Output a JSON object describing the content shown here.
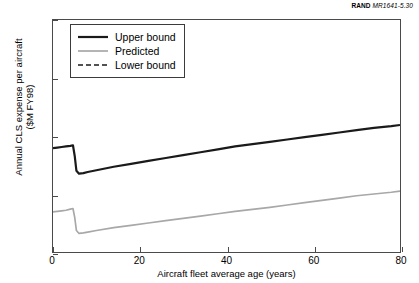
{
  "source_credit": {
    "organization": "RAND",
    "identifier": "MR1641-5.30"
  },
  "chart_data": {
    "type": "line",
    "title": "",
    "xlabel": "Aircraft fleet average age (years)",
    "ylabel": "Annual CLS expense per aircraft\n($M FY98)",
    "xlim": [
      0,
      80
    ],
    "ylim": [
      0,
      20
    ],
    "xticks": [
      0,
      20,
      40,
      60,
      80
    ],
    "yticks": [
      0,
      5,
      10,
      15,
      20
    ],
    "xtick_labels": [
      "0",
      "20",
      "40",
      "60",
      "80"
    ],
    "ytick_labels": [
      "0",
      "5",
      "10",
      "15",
      "20"
    ],
    "grid": false,
    "legend_position": "upper-left-inside",
    "series": [
      {
        "name": "Upper bound",
        "color": "#1a1a1a",
        "style": "solid",
        "width": 2.2,
        "x": [
          0,
          1,
          2,
          3,
          4,
          4.6,
          5,
          5.4,
          6,
          7,
          8,
          10,
          14,
          18,
          22,
          26,
          30,
          34,
          38,
          42,
          46,
          50,
          54,
          58,
          62,
          66,
          70,
          74,
          78,
          80
        ],
        "y": [
          8.95,
          9.0,
          9.05,
          9.1,
          9.15,
          9.2,
          8.3,
          7.0,
          6.75,
          6.8,
          6.9,
          7.05,
          7.35,
          7.6,
          7.85,
          8.1,
          8.35,
          8.6,
          8.85,
          9.1,
          9.3,
          9.5,
          9.7,
          9.9,
          10.1,
          10.3,
          10.5,
          10.7,
          10.85,
          10.95
        ]
      },
      {
        "name": "Predicted",
        "color": "#a8a8a8",
        "style": "solid",
        "width": 1.7,
        "x": [
          0,
          1,
          2,
          3,
          4,
          4.6,
          5,
          5.4,
          6,
          7,
          8,
          10,
          14,
          18,
          22,
          26,
          30,
          34,
          38,
          42,
          46,
          50,
          54,
          58,
          62,
          66,
          70,
          74,
          78,
          80
        ],
        "y": [
          3.45,
          3.5,
          3.55,
          3.6,
          3.7,
          3.75,
          3.0,
          1.85,
          1.6,
          1.65,
          1.72,
          1.85,
          2.1,
          2.3,
          2.5,
          2.7,
          2.9,
          3.1,
          3.3,
          3.5,
          3.68,
          3.85,
          4.05,
          4.25,
          4.45,
          4.65,
          4.85,
          5.0,
          5.15,
          5.25
        ]
      },
      {
        "name": "Lower bound",
        "color": "#1a1a1a",
        "style": "dashed",
        "width": 1.5,
        "x": [],
        "y": []
      }
    ]
  },
  "legend": {
    "items": [
      {
        "label": "Upper bound",
        "swatch": "solid-black-thick"
      },
      {
        "label": "Predicted",
        "swatch": "solid-gray"
      },
      {
        "label": "Lower bound",
        "swatch": "dashed-black"
      }
    ]
  }
}
